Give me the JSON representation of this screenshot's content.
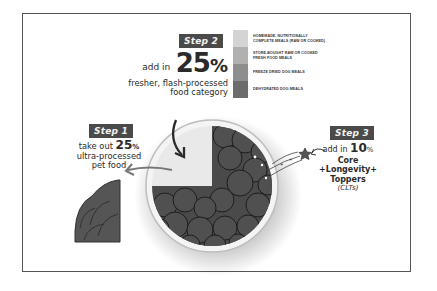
{
  "step1": {
    "badge": "Step 1",
    "line1_prefix": "take out ",
    "line1_number": "25",
    "line1_suffix": "%",
    "line2": "ultra-processed",
    "line3": "pet food"
  },
  "step2": {
    "badge": "Step 2",
    "prefix": "add in",
    "number": "25",
    "suffix": "%",
    "line2": "fresher, flash-processed",
    "line3": "food category"
  },
  "step3": {
    "badge": "Step 3",
    "prefix": "add in ",
    "number": "10",
    "suffix": "%",
    "line2": "Core",
    "line3": "+Longevity+",
    "line4": "Toppers",
    "line5": "(CLTs)"
  },
  "legend": [
    {
      "label": "Homemade, nutritionally complete meals (raw or cooked)",
      "color": "#d4d4d4"
    },
    {
      "label": "Store-bought raw or cooked fresh food meals",
      "color": "#b0b0b0"
    },
    {
      "label": "Freeze dried dog meals",
      "color": "#8e8e8e"
    },
    {
      "label": "Dehydrated dog meals",
      "color": "#6c6c6c"
    }
  ],
  "colors": {
    "badge_bg": "#4a4a4a",
    "food": "#4a4a4a",
    "frame": "#555555",
    "plate": "#f2f2f2"
  }
}
